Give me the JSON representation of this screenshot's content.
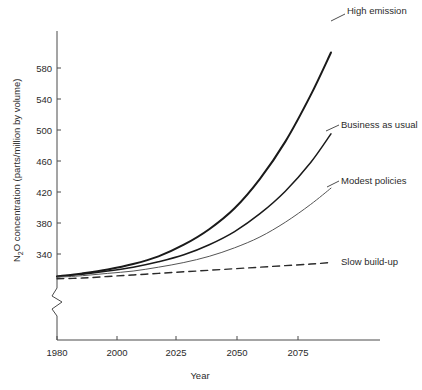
{
  "chart_data": {
    "type": "line",
    "title": "",
    "xlabel": "Year",
    "ylabel": "N2O concentration (parts/million by volume)",
    "ylabel_parts": {
      "pre": "N",
      "sub": "2",
      "post": "O concentration (parts/million by volume)"
    },
    "xlim": [
      1980,
      2090
    ],
    "ylim": [
      305,
      600
    ],
    "xticks": [
      1980,
      2000,
      2025,
      2050,
      2075
    ],
    "xtick_labels": [
      "1980",
      "2000",
      "2025",
      "2050",
      "2075"
    ],
    "yticks": [
      340,
      380,
      420,
      460,
      500,
      540,
      580
    ],
    "ytick_labels": [
      "340",
      "380",
      "420",
      "460",
      "500",
      "540",
      "580"
    ],
    "grid": false,
    "axis_break": true,
    "axis_break_note": "zigzag break on y-axis below 340",
    "legend_position": "inline-right-end-labels",
    "series": [
      {
        "name": "High emission",
        "label": "High emission",
        "color": "#1a1a1a",
        "line_style": "solid",
        "line_width": 2.0,
        "x": [
          1980,
          1990,
          2000,
          2010,
          2020,
          2030,
          2040,
          2050,
          2060,
          2070,
          2080,
          2088
        ],
        "values": [
          311,
          315,
          320,
          327,
          337,
          352,
          372,
          399,
          437,
          485,
          545,
          600
        ]
      },
      {
        "name": "Business as usual",
        "label": "Business as usual",
        "color": "#1a1a1a",
        "line_style": "solid",
        "line_width": 1.5,
        "x": [
          1980,
          1990,
          2000,
          2010,
          2020,
          2030,
          2040,
          2050,
          2060,
          2070,
          2080,
          2088
        ],
        "values": [
          311,
          314,
          318,
          323,
          330,
          339,
          352,
          369,
          392,
          421,
          458,
          495
        ]
      },
      {
        "name": "Modest policies",
        "label": "Modest policies",
        "color": "#555555",
        "line_style": "solid",
        "line_width": 1.0,
        "x": [
          1980,
          1990,
          2000,
          2010,
          2020,
          2030,
          2040,
          2050,
          2060,
          2070,
          2080,
          2088
        ],
        "values": [
          310,
          312,
          315,
          318,
          323,
          329,
          337,
          348,
          362,
          381,
          404,
          425
        ]
      },
      {
        "name": "Slow build-up",
        "label": "Slow build-up",
        "color": "#2b2b2b",
        "line_style": "dashed",
        "line_width": 1.4,
        "x": [
          1980,
          1990,
          2000,
          2010,
          2020,
          2030,
          2040,
          2050,
          2060,
          2070,
          2080,
          2088
        ],
        "values": [
          308,
          309,
          311,
          313,
          315,
          317,
          319,
          321,
          323,
          325,
          327,
          329
        ]
      }
    ]
  },
  "axis": {
    "x_title": "Year"
  }
}
